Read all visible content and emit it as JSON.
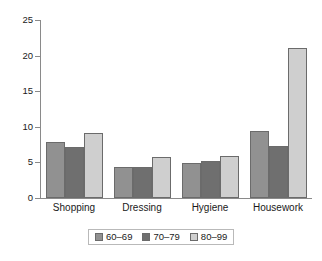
{
  "chart_data": {
    "type": "bar",
    "title": "",
    "subtitle": "",
    "xlabel": "",
    "ylabel": "",
    "categories": [
      "Shopping",
      "Dressing",
      "Hygiene",
      "Housework"
    ],
    "series": [
      {
        "name": "60–69",
        "color": "#919191",
        "values": [
          7.9,
          4.3,
          4.9,
          9.4
        ]
      },
      {
        "name": "70–79",
        "color": "#6f6f6f",
        "values": [
          7.2,
          4.4,
          5.2,
          7.3
        ]
      },
      {
        "name": "80–99",
        "color": "#cfcfcf",
        "values": [
          9.2,
          5.7,
          5.9,
          21.0
        ]
      }
    ],
    "ylim": [
      0,
      25
    ],
    "yticks": [
      0,
      5,
      10,
      15,
      20,
      25
    ],
    "ytick_labels": [
      "0",
      "5",
      "10",
      "15",
      "20",
      "25"
    ],
    "grid": false,
    "legend_position": "bottom",
    "annotations": []
  }
}
